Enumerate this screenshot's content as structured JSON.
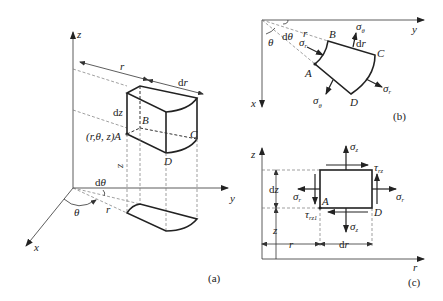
{
  "figure": {
    "panel_a": {
      "caption": "(a)",
      "axes": {
        "z": "z",
        "y": "y",
        "x": "x"
      },
      "labels": {
        "r": "r",
        "dr": "dr",
        "dz": "dz",
        "point_A": "(r,θ, z)A",
        "B": "B",
        "C": "C",
        "D": "D",
        "z_height": "z",
        "dtheta": "dθ",
        "theta": "θ",
        "r_base": "r"
      }
    },
    "panel_b": {
      "caption": "(b)",
      "axes": {
        "y": "y",
        "x": "x"
      },
      "labels": {
        "theta": "θ",
        "dtheta": "dθ",
        "r": "r",
        "dr": "dr",
        "A": "A",
        "B": "B",
        "C": "C",
        "D": "D"
      },
      "stresses": {
        "sigma_theta_top": {
          "main": "σ",
          "sub": "θ"
        },
        "sigma_theta_bottom": {
          "main": "σ",
          "sub": "θ"
        },
        "sigma_r_left": {
          "main": "σ",
          "sub": "r"
        },
        "sigma_r_right": {
          "main": "σ",
          "sub": "r"
        }
      }
    },
    "panel_c": {
      "caption": "(c)",
      "axes": {
        "z": "z",
        "r": "r"
      },
      "labels": {
        "dz": "dz",
        "z": "z",
        "r": "r",
        "dr": "dr",
        "A": "A",
        "D": "D"
      },
      "stresses": {
        "sigma_z_top": {
          "main": "σ",
          "sub": "z"
        },
        "sigma_z_bottom": {
          "main": "σ",
          "sub": "z"
        },
        "sigma_r_left": {
          "main": "σ",
          "sub": "r"
        },
        "sigma_r_right": {
          "main": "σ",
          "sub": "r"
        },
        "tau_rz_top": {
          "main": "τ",
          "sub": "rz"
        },
        "tau_rz_bottom": {
          "main": "τ",
          "sub": "rz1"
        }
      }
    }
  }
}
